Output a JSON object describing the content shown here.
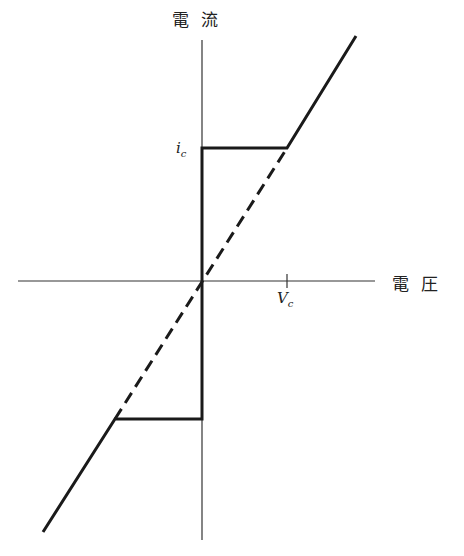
{
  "diagram": {
    "type": "current-voltage characteristic",
    "y_axis_label": "電流",
    "x_axis_label": "電圧",
    "current_mark": {
      "symbol": "i",
      "subscript": "c"
    },
    "voltage_mark": {
      "symbol": "V",
      "subscript": "c"
    },
    "colors": {
      "line": "#1a1a1a",
      "axis": "#333333",
      "background": "#ffffff"
    },
    "segments": [
      {
        "name": "upper-vertical",
        "style": "solid"
      },
      {
        "name": "upper-horizontal",
        "style": "solid"
      },
      {
        "name": "upper-diagonal",
        "style": "solid"
      },
      {
        "name": "ohmic-dashed",
        "style": "dashed"
      },
      {
        "name": "lower-vertical",
        "style": "solid"
      },
      {
        "name": "lower-horizontal",
        "style": "solid"
      },
      {
        "name": "lower-diagonal",
        "style": "solid"
      }
    ]
  }
}
